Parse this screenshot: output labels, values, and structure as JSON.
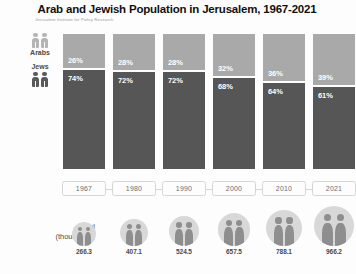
{
  "header": {
    "title": "Arab and Jewish Population in Jerusalem, 1967-2021",
    "subtitle": "Jerusalem Institute for Policy Research"
  },
  "legend": {
    "arabs": {
      "label": "Arabs",
      "icon": "two-people-icon",
      "color": "#b4b4b4"
    },
    "jews": {
      "label": "Jews",
      "icon": "two-people-icon",
      "color": "#5a5a5a"
    }
  },
  "totals_axis": {
    "label_line1": "Total",
    "label_line2": "(thousands)",
    "icon": "people-in-circle-icon"
  },
  "chart_data": {
    "type": "bar",
    "title": "Arab and Jewish Population in Jerusalem, 1967-2021",
    "subtitle": "Jerusalem Institute for Policy Research",
    "xlabel": "",
    "ylabel": "",
    "ylim": [
      0,
      100
    ],
    "grid": false,
    "legend_position": "left",
    "stacked": true,
    "unit": "percent",
    "categories": [
      "1967",
      "1980",
      "1990",
      "2000",
      "2010",
      "2021"
    ],
    "series": [
      {
        "name": "Arabs",
        "color": "#a9a9a9",
        "values": [
          26,
          28,
          28,
          32,
          36,
          39
        ],
        "labels": [
          "26%",
          "28%",
          "28%",
          "32%",
          "36%",
          "39%"
        ]
      },
      {
        "name": "Jews",
        "color": "#565656",
        "values": [
          74,
          72,
          72,
          68,
          64,
          61
        ],
        "labels": [
          "74%",
          "72%",
          "72%",
          "68%",
          "64%",
          "61%"
        ]
      }
    ],
    "totals": {
      "name": "Total (thousands)",
      "values": [
        266.3,
        407.1,
        524.5,
        657.5,
        788.1,
        966.2
      ],
      "labels": [
        "266.3",
        "407.1",
        "524.5",
        "657.5",
        "788.1",
        "966.2"
      ]
    }
  }
}
